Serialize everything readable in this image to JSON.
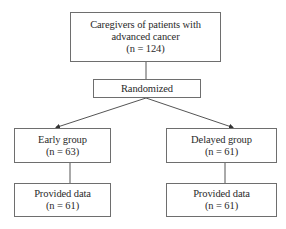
{
  "diagram": {
    "type": "flowchart",
    "nodes": {
      "population": {
        "line1": "Caregivers of patients with",
        "line2": "advanced cancer",
        "count": "(n = 124)"
      },
      "randomized": {
        "label": "Randomized"
      },
      "early_group": {
        "label": "Early group",
        "count": "(n = 63)"
      },
      "delayed_group": {
        "label": "Delayed group",
        "count": "(n = 61)"
      },
      "early_provided": {
        "label": "Provided data",
        "count": "(n = 61)"
      },
      "delayed_provided": {
        "label": "Provided data",
        "count": "(n = 61)"
      }
    },
    "edges": [
      {
        "from": "population",
        "to": "randomized"
      },
      {
        "from": "randomized",
        "to": "early_group",
        "arrow": true
      },
      {
        "from": "randomized",
        "to": "delayed_group",
        "arrow": true
      },
      {
        "from": "early_group",
        "to": "early_provided"
      },
      {
        "from": "delayed_group",
        "to": "delayed_provided"
      }
    ],
    "colors": {
      "border": "#6e6e6e",
      "line": "#555555",
      "text": "#2a2a2a",
      "background": "#ffffff"
    }
  }
}
